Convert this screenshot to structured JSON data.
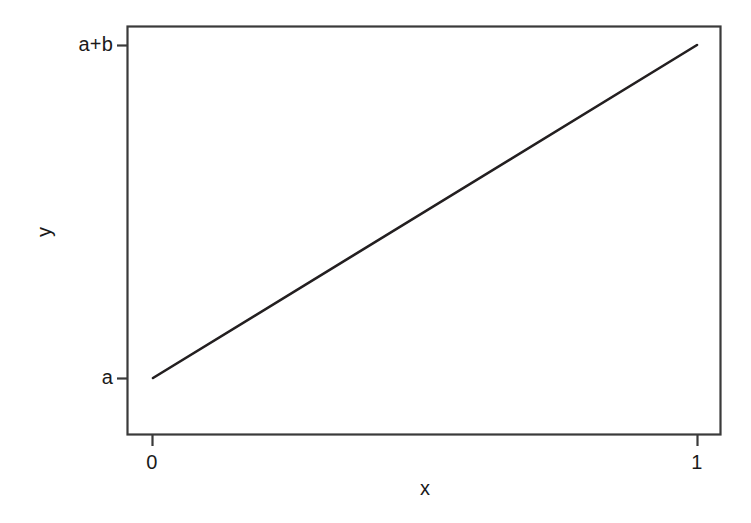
{
  "chart_data": {
    "type": "line",
    "title": "",
    "subtitle": "",
    "xlabel": "x",
    "ylabel": "y",
    "xlim": [
      0,
      1
    ],
    "ylim": [
      "a",
      "a+b"
    ],
    "grid": false,
    "legend": null,
    "annotations": [],
    "x_tick_labels": [
      "0",
      "1"
    ],
    "x_tick_values": [
      0,
      1
    ],
    "y_tick_labels": [
      "a",
      "a+b"
    ],
    "y_tick_values": [
      "a",
      "a+b"
    ],
    "series": [
      {
        "name": "y = a + b x",
        "x": [
          0,
          1
        ],
        "y": [
          "a",
          "a+b"
        ],
        "color": "#231f20",
        "line_width": 2.6,
        "style": "solid"
      }
    ]
  },
  "axes": {
    "x": {
      "title": "x",
      "ticks": [
        {
          "label": "0",
          "value": 0
        },
        {
          "label": "1",
          "value": 1
        }
      ]
    },
    "y": {
      "title": "y",
      "ticks": [
        {
          "label": "a+b",
          "value": 1
        },
        {
          "label": "a",
          "value": 0
        }
      ]
    }
  },
  "style": {
    "background": "#ffffff",
    "ink": "#231f20",
    "frame_color": "#3a3a3a",
    "line_color": "#231f20"
  }
}
